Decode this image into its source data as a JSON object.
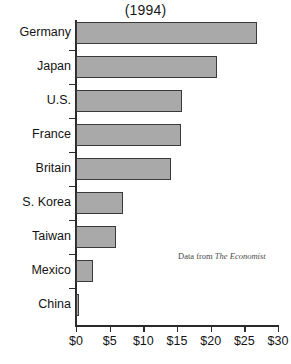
{
  "chart_data": {
    "type": "bar",
    "orientation": "horizontal",
    "title": "(1994)",
    "xlabel": "",
    "ylabel": "",
    "categories": [
      "Germany",
      "Japan",
      "U.S.",
      "France",
      "Britain",
      "S. Korea",
      "Taiwan",
      "Mexico",
      "China"
    ],
    "values": [
      26.9,
      20.9,
      15.7,
      15.6,
      14.1,
      7.0,
      6.0,
      2.5,
      0.5
    ],
    "xlim": [
      0,
      30
    ],
    "xticks": [
      0,
      5,
      10,
      15,
      20,
      25,
      30
    ],
    "xticklabels": [
      "$0",
      "$5",
      "$10",
      "$15",
      "$20",
      "$25",
      "$30"
    ],
    "grid": false,
    "legend": null,
    "bar_color": "#a9a9a9",
    "bar_edge_color": "#3a3a3a",
    "axis_color": "#2b2b2b",
    "background_color": "#ffffff",
    "annotations": [
      {
        "name": "source-note",
        "prefix": "Data from ",
        "publication": "The Economist"
      }
    ]
  }
}
